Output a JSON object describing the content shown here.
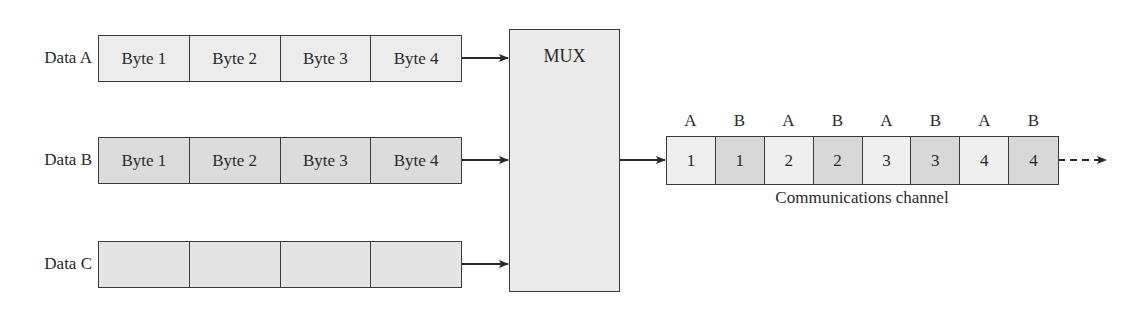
{
  "diagram": {
    "type": "time-division multiplexing",
    "inputs": [
      {
        "label": "Data A",
        "cells": [
          "Byte 1",
          "Byte 2",
          "Byte 3",
          "Byte 4"
        ],
        "fill": "#ececec"
      },
      {
        "label": "Data B",
        "cells": [
          "Byte 1",
          "Byte 2",
          "Byte 3",
          "Byte 4"
        ],
        "fill": "#dcdcdc"
      },
      {
        "label": "Data C",
        "cells": [
          "",
          "",
          "",
          ""
        ],
        "fill": "#e4e4e4"
      }
    ],
    "mux": {
      "label": "MUX"
    },
    "channel": {
      "source_labels": [
        "A",
        "B",
        "A",
        "B",
        "A",
        "B",
        "A",
        "B"
      ],
      "cells": [
        "1",
        "1",
        "2",
        "2",
        "3",
        "3",
        "4",
        "4"
      ],
      "caption": "Communications channel",
      "colors": {
        "A": "#efefef",
        "B": "#d8d8d8"
      }
    },
    "edges": [
      {
        "from": "Data A",
        "to": "MUX",
        "style": "solid"
      },
      {
        "from": "Data B",
        "to": "MUX",
        "style": "solid"
      },
      {
        "from": "Data C",
        "to": "MUX",
        "style": "solid"
      },
      {
        "from": "MUX",
        "to": "Communications channel",
        "style": "solid"
      },
      {
        "from": "Communications channel",
        "to": "continuation",
        "style": "dashed"
      }
    ]
  }
}
